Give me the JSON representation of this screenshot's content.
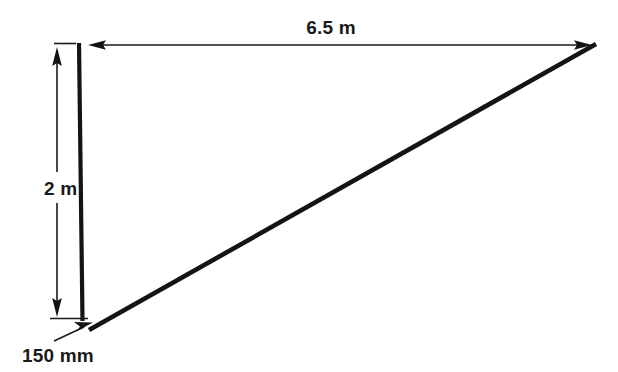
{
  "diagram": {
    "background_color": "#ffffff",
    "line_color": "#141414",
    "text_color": "#1a1a1a",
    "labels": {
      "horizontal_span": "6.5 m",
      "vertical_height": "2 m",
      "base_offset": "150 mm"
    },
    "measurements": [
      {
        "name": "horizontal-span",
        "value": "6.5",
        "unit": "m",
        "label": "6.5 m"
      },
      {
        "name": "vertical-height",
        "value": "2",
        "unit": "m",
        "label": "2 m"
      },
      {
        "name": "base-offset",
        "value": "150",
        "unit": "mm",
        "label": "150 mm"
      }
    ],
    "geometry": {
      "pole": {
        "x_top": 79,
        "y_top": 44,
        "x_bottom": 82.5,
        "y_bottom": 321,
        "width": 4.2
      },
      "diagonal": {
        "x_start": 89,
        "y_start": 330,
        "x_end": 596,
        "y_end": 44,
        "width": 4.6
      },
      "horizontal_dimension_line": {
        "x_start": 90,
        "x_end": 590,
        "y": 45
      },
      "vertical_dimension_line": {
        "x": 57,
        "y_start": 48,
        "y_end": 318
      },
      "top_extension_tick": {
        "x_start": 54,
        "x_end": 76,
        "y": 44
      },
      "bottom_extension_tick": {
        "x_start": 50,
        "x_end": 88,
        "y": 318
      },
      "leader_line": {
        "x_start": 54,
        "y_start": 341,
        "x_end": 92,
        "y_end": 323
      }
    }
  }
}
